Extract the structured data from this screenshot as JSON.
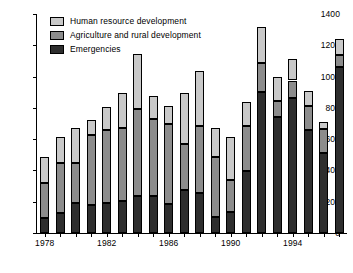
{
  "chart_data": {
    "type": "bar",
    "subtype": "stacked-vertical",
    "title": "",
    "xlabel": "",
    "ylabel": "",
    "ylim": [
      0,
      1400
    ],
    "y_ticks": [
      0,
      200,
      400,
      600,
      800,
      1000,
      1200,
      1400
    ],
    "y_tick_labels": [
      "0",
      "200",
      "400",
      "600",
      "800",
      "1000",
      "1200",
      "1400"
    ],
    "grid": false,
    "legend_position": "top-left",
    "categories": [
      "1978",
      "1979",
      "1980",
      "1981",
      "1982",
      "1983",
      "1984",
      "1985",
      "1986",
      "1987",
      "1988",
      "1989",
      "1990",
      "1991",
      "1992",
      "1993",
      "1994",
      "1995",
      "1996",
      "1997"
    ],
    "x_tick_labels_shown": [
      "1978",
      "1982",
      "1986",
      "1990",
      "1994"
    ],
    "x_tick_label_indices": [
      0,
      4,
      8,
      12,
      16
    ],
    "series": [
      {
        "name": "Emergencies",
        "key": "emergencies",
        "color": "#2e2e2e",
        "values": [
          95,
          125,
          195,
          180,
          195,
          205,
          235,
          235,
          185,
          275,
          255,
          100,
          135,
          395,
          900,
          740,
          860,
          660,
          510,
          1060
        ]
      },
      {
        "name": "Agriculture and rural development",
        "key": "agriculture",
        "color": "#8c8c8c",
        "values": [
          225,
          325,
          250,
          445,
          465,
          465,
          555,
          495,
          510,
          295,
          430,
          385,
          205,
          290,
          190,
          105,
          115,
          155,
          155,
          80
        ]
      },
      {
        "name": "Human resource development",
        "key": "human_resource",
        "color": "#c9c9c9",
        "values": [
          165,
          165,
          225,
          95,
          145,
          225,
          355,
          145,
          115,
          325,
          350,
          185,
          275,
          155,
          230,
          150,
          140,
          90,
          45,
          100
        ]
      }
    ],
    "totals": [
      485,
      615,
      670,
      720,
      805,
      895,
      1145,
      875,
      810,
      895,
      1035,
      670,
      615,
      840,
      1320,
      995,
      1115,
      905,
      710,
      1240
    ]
  },
  "legend": {
    "items": [
      {
        "label": "Human resource development",
        "swatch": "#c9c9c9"
      },
      {
        "label": "Agriculture and rural development",
        "swatch": "#8c8c8c"
      },
      {
        "label": "Emergencies",
        "swatch": "#2e2e2e"
      }
    ]
  }
}
